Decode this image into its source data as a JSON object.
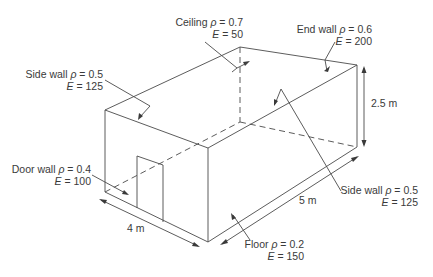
{
  "diagram": {
    "surfaces": [
      {
        "id": "ceiling",
        "name": "Ceiling",
        "rho_symbol": "ρ",
        "rho": "0.7",
        "e_symbol": "E",
        "e": "50"
      },
      {
        "id": "end_wall",
        "name": "End wall",
        "rho_symbol": "ρ",
        "rho": "0.6",
        "e_symbol": "E",
        "e": "200"
      },
      {
        "id": "side_wall_left",
        "name": "Side wall",
        "rho_symbol": "ρ",
        "rho": "0.5",
        "e_symbol": "E",
        "e": "125"
      },
      {
        "id": "door_wall",
        "name": "Door wall",
        "rho_symbol": "ρ",
        "rho": "0.4",
        "e_symbol": "E",
        "e": "100"
      },
      {
        "id": "side_wall_right",
        "name": "Side wall",
        "rho_symbol": "ρ",
        "rho": "0.5",
        "e_symbol": "E",
        "e": "125"
      },
      {
        "id": "floor",
        "name": "Floor",
        "rho_symbol": "ρ",
        "rho": "0.2",
        "e_symbol": "E",
        "e": "150"
      }
    ],
    "dimensions": {
      "height": "2.5 m",
      "length": "5 m",
      "width": "4 m"
    }
  }
}
